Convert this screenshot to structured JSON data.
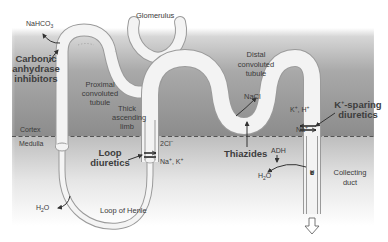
{
  "diagram": {
    "regions": {
      "cortex": "Cortex",
      "medulla": "Medulla"
    },
    "structures": {
      "glomerulus": "Glomerulus",
      "proximal": "Proximal convoluted tubule",
      "thick_ascending": "Thick ascending limb",
      "distal": "Distal convoluted tubule",
      "loop_of_henle": "Loop of Henle",
      "collecting_duct": "Collecting duct",
      "urine": [
        "U",
        "r",
        "i",
        "n",
        "e"
      ]
    },
    "drugs": {
      "carbonic": "Carbonic anhydrase inhibitors",
      "loop": "Loop diuretics",
      "thiazides": "Thiazides",
      "k_sparing": "K+-sparing diuretics"
    },
    "solutes": {
      "nahco3": "NaHCO3",
      "nacl": "NaCl",
      "two_cl": "2Cl−",
      "na_k": "Na+, K+",
      "k_h": "K+, H+",
      "na": "Na+",
      "h2o_left": "H2O",
      "h2o_right": "H2O",
      "adh": "ADH"
    },
    "colors": {
      "cortex_gray": "#8f8f8f",
      "tubule_fill": "#f2f2f2",
      "tubule_edge": "#9a9a9a",
      "text": "#3a3a3a"
    }
  }
}
